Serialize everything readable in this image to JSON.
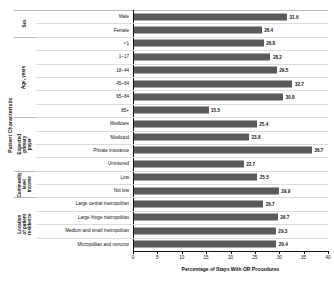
{
  "chart_data": {
    "type": "bar",
    "orientation": "horizontal",
    "title": "",
    "xlabel": "Percentage of Stays With OR Procedures",
    "ylabel": "Patient Characteristic",
    "xlim": [
      0,
      40
    ],
    "xticks": [
      0,
      5,
      10,
      15,
      20,
      25,
      30,
      35,
      40
    ],
    "grid": false,
    "legend": null,
    "bar_color": "#5a5a5a",
    "categories": [
      "Male",
      "Female",
      "<1",
      "1–17",
      "18–44",
      "45–64",
      "65–84",
      "85+",
      "Medicare",
      "Medicaid",
      "Private insurance",
      "Uninsured",
      "Low",
      "Not low",
      "Large central metropolitan",
      "Large fringe metropolitan",
      "Medium and small metropolitan",
      "Micropolitan and noncore"
    ],
    "values": [
      31.6,
      26.4,
      26.8,
      28.2,
      29.5,
      32.7,
      30.8,
      15.5,
      25.4,
      23.8,
      36.7,
      22.7,
      25.5,
      29.9,
      26.7,
      29.7,
      29.3,
      29.4
    ],
    "groups": [
      {
        "label": "Sex",
        "count": 2
      },
      {
        "label": "Age, years",
        "count": 6
      },
      {
        "label": "Expected primary payer",
        "count": 4
      },
      {
        "label": "Community-level income",
        "count": 2
      },
      {
        "label": "Location of patient residence",
        "count": 4
      }
    ]
  }
}
